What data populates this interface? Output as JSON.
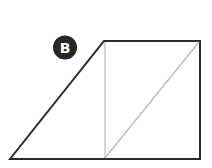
{
  "figure": {
    "label": "B",
    "colors": {
      "outline": "#2a2a2a",
      "construction": "#b8b8b8",
      "badge_bg": "#262626",
      "badge_text": "#ffffff"
    },
    "shapes": {
      "outline_polygon": "10,159 104,41 200,41 200,159",
      "vertical_divider": {
        "x1": 105,
        "y1": 41,
        "x2": 105,
        "y2": 159
      },
      "diagonal": {
        "x1": 105,
        "y1": 159,
        "x2": 199,
        "y2": 42
      }
    }
  }
}
